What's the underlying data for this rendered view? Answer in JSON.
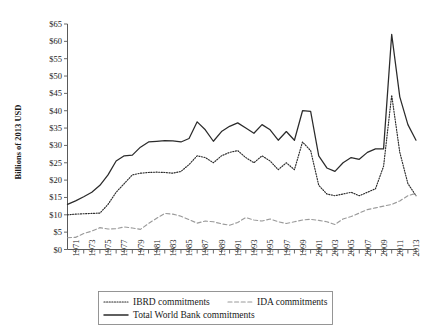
{
  "chart_data": {
    "type": "line",
    "title": "",
    "xlabel": "",
    "ylabel": "Billions of 2013 USD",
    "ylim": [
      0,
      65
    ],
    "xlim": [
      1970,
      2013
    ],
    "grid": false,
    "legend_position": "bottom",
    "ytick_labels": [
      "$0",
      "$5",
      "$10",
      "$15",
      "$20",
      "$25",
      "$30",
      "$35",
      "$40",
      "$45",
      "$50",
      "$55",
      "$60",
      "$65"
    ],
    "ytick_values": [
      0,
      5,
      10,
      15,
      20,
      25,
      30,
      35,
      40,
      45,
      50,
      55,
      60,
      65
    ],
    "x": [
      1970,
      1971,
      1972,
      1973,
      1974,
      1975,
      1976,
      1977,
      1978,
      1979,
      1980,
      1981,
      1982,
      1983,
      1984,
      1985,
      1986,
      1987,
      1988,
      1989,
      1990,
      1991,
      1992,
      1993,
      1994,
      1995,
      1996,
      1997,
      1998,
      1999,
      2000,
      2001,
      2002,
      2003,
      2004,
      2005,
      2006,
      2007,
      2008,
      2009,
      2010,
      2011,
      2012,
      2013
    ],
    "xtick_labels": [
      "1971",
      "1973",
      "1975",
      "1977",
      "1979",
      "1981",
      "1983",
      "1985",
      "1987",
      "1989",
      "1991",
      "1993",
      "1995",
      "1997",
      "1999",
      "2001",
      "2003",
      "2005",
      "2007",
      "2009",
      "2011",
      "2013"
    ],
    "xtick_values": [
      1971,
      1973,
      1975,
      1977,
      1979,
      1981,
      1983,
      1985,
      1987,
      1989,
      1991,
      1993,
      1995,
      1997,
      1999,
      2001,
      2003,
      2005,
      2007,
      2009,
      2011,
      2013
    ],
    "series": [
      {
        "name": "IBRD commitments",
        "style": "dotted",
        "color": "#2b2b2b",
        "values": [
          10.0,
          10.2,
          10.3,
          10.4,
          10.5,
          13.0,
          16.5,
          19.0,
          21.5,
          22.0,
          22.2,
          22.3,
          22.2,
          22.0,
          22.5,
          24.5,
          27.0,
          26.5,
          25.0,
          27.0,
          28.0,
          28.5,
          26.5,
          25.0,
          27.0,
          25.5,
          23.0,
          25.0,
          23.0,
          31.0,
          28.5,
          18.5,
          16.0,
          15.5,
          16.0,
          16.5,
          15.5,
          16.5,
          17.5,
          24.0,
          44.5,
          28.0,
          19.0,
          15.5
        ]
      },
      {
        "name": "IDA commitments",
        "style": "dashed",
        "color": "#9a9a9a",
        "values": [
          3.4,
          3.5,
          4.6,
          5.3,
          6.3,
          5.9,
          6.0,
          6.5,
          6.2,
          5.8,
          7.5,
          9.0,
          10.4,
          10.2,
          9.6,
          8.6,
          7.6,
          8.2,
          8.0,
          7.4,
          7.0,
          7.8,
          9.2,
          8.5,
          8.2,
          8.8,
          8.0,
          7.5,
          8.0,
          8.5,
          8.7,
          8.4,
          8.0,
          7.2,
          8.8,
          9.5,
          10.5,
          11.5,
          12.0,
          12.5,
          13.0,
          14.0,
          15.5,
          16.2
        ]
      },
      {
        "name": "Total World Bank commitments",
        "style": "solid",
        "color": "#2b2b2b",
        "values": [
          13.0,
          14.0,
          15.2,
          16.5,
          18.5,
          21.5,
          25.5,
          27.0,
          27.2,
          29.5,
          31.0,
          31.2,
          31.4,
          31.3,
          31.0,
          32.0,
          36.8,
          34.5,
          31.2,
          34.0,
          35.5,
          36.5,
          35.0,
          33.5,
          36.0,
          34.5,
          31.5,
          34.0,
          31.5,
          40.0,
          39.8,
          27.0,
          23.5,
          22.5,
          25.0,
          26.5,
          26.0,
          28.0,
          29.0,
          29.0,
          62.0,
          44.0,
          36.0,
          31.5
        ]
      }
    ]
  },
  "legend": {
    "entries": [
      {
        "label": "IBRD commitments",
        "style": "dotted"
      },
      {
        "label": "IDA commitments",
        "style": "dashed"
      },
      {
        "label": "Total World Bank commitments",
        "style": "solid"
      }
    ]
  }
}
